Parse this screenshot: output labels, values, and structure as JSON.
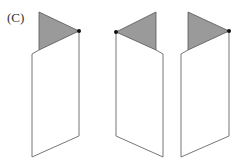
{
  "label": "(C)",
  "colors": {
    "flag_fill": "#9a9a9a",
    "flag_stroke": "#555555",
    "panel_stroke": "#777777",
    "dot": "#111111",
    "background": "#ffffff"
  },
  "figures": [
    {
      "id": "figure-1",
      "flag_points": "39,12 79,31 39,50",
      "outline_points": "39,50 32,54 32,157 79,136 79,31",
      "dot": {
        "cx": 79,
        "cy": 31
      },
      "flag_direction": "right"
    },
    {
      "id": "figure-2",
      "flag_points": "156,12 116,32 156,50",
      "outline_points": "156,50 163,54 163,157 116,136 116,32",
      "dot": {
        "cx": 116,
        "cy": 32
      },
      "flag_direction": "left"
    },
    {
      "id": "figure-3",
      "flag_points": "188,12 229,31 188,50",
      "outline_points": "188,50 181,54 181,157 229,136 229,31",
      "dot": {
        "cx": 229,
        "cy": 31
      },
      "flag_direction": "right"
    }
  ]
}
